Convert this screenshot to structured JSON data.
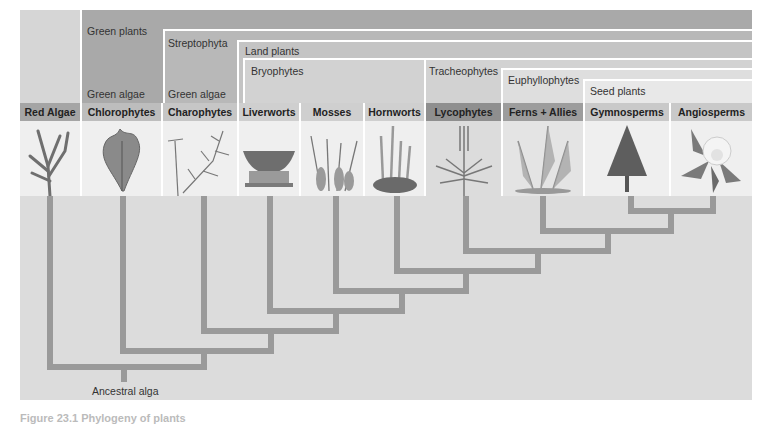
{
  "diagram": {
    "type": "phylogenetic-tree",
    "root_label": "Ancestral alga",
    "caption_fragment": "Figure 23.1 Phylogeny of plants",
    "clades": [
      {
        "name": "Green plants",
        "color": "#a9a9a9"
      },
      {
        "name": "Streptophyta",
        "color": "#b8b8b8"
      },
      {
        "name": "Land plants",
        "color": "#c4c4c4"
      },
      {
        "name": "Bryophytes",
        "color": "#d2d2d2"
      },
      {
        "name": "Tracheophytes",
        "color": "#d2d2d2"
      },
      {
        "name": "Euphyllophytes",
        "color": "#dedede"
      },
      {
        "name": "Seed plants",
        "color": "#e8e8e8"
      }
    ],
    "sub_labels": {
      "chlorophytes_group": "Green algae",
      "charophytes_group": "Green algae"
    },
    "taxa": [
      {
        "name": "Red Algae",
        "label_color": "#a5a5a5",
        "icon": "red-algae-illustration"
      },
      {
        "name": "Chlorophytes",
        "label_color": "#bdbdbd",
        "icon": "chlorophyte-illustration"
      },
      {
        "name": "Charophytes",
        "label_color": "#c6c6c6",
        "icon": "charophyte-illustration"
      },
      {
        "name": "Liverworts",
        "label_color": "#cfcfcf",
        "icon": "liverwort-illustration"
      },
      {
        "name": "Mosses",
        "label_color": "#cfcfcf",
        "icon": "moss-illustration"
      },
      {
        "name": "Hornworts",
        "label_color": "#cfcfcf",
        "icon": "hornwort-illustration"
      },
      {
        "name": "Lycophytes",
        "label_color": "#8f8f8f",
        "icon": "lycophyte-illustration"
      },
      {
        "name": "Ferns + Allies",
        "label_color": "#9d9d9d",
        "icon": "fern-illustration"
      },
      {
        "name": "Gymnosperms",
        "label_color": "#c9c9c9",
        "icon": "gymnosperm-illustration"
      },
      {
        "name": "Angiosperms",
        "label_color": "#c9c9c9",
        "icon": "angiosperm-illustration"
      }
    ]
  }
}
